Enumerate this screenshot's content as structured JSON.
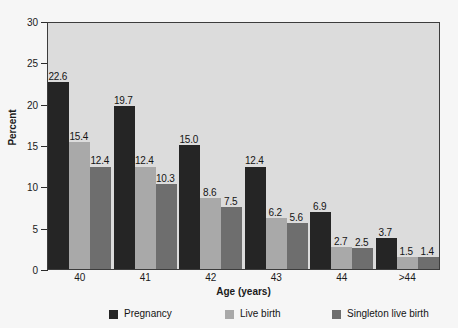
{
  "chart_data": {
    "type": "bar",
    "title": "",
    "xlabel": "Age (years)",
    "ylabel": "Percent",
    "categories": [
      "40",
      "41",
      "42",
      "43",
      "44",
      ">44"
    ],
    "series": [
      {
        "name": "Pregnancy",
        "color": "#252525",
        "values": [
          22.6,
          19.7,
          15.0,
          12.4,
          6.9,
          3.7
        ]
      },
      {
        "name": "Live birth",
        "color": "#a9a9a9",
        "values": [
          15.4,
          12.4,
          8.6,
          6.2,
          2.7,
          1.5
        ]
      },
      {
        "name": "Singleton live birth",
        "color": "#6e6e6e",
        "values": [
          12.4,
          10.3,
          7.5,
          5.6,
          2.5,
          1.4
        ]
      }
    ],
    "value_labels": [
      [
        "22.6",
        "15.4",
        "12.4"
      ],
      [
        "19.7",
        "12.4",
        "10.3"
      ],
      [
        "15.0",
        "8.6",
        "7.5"
      ],
      [
        "12.4",
        "6.2",
        "5.6"
      ],
      [
        "6.9",
        "2.7",
        "2.5"
      ],
      [
        "3.7",
        "1.5",
        "1.4"
      ]
    ],
    "ylim": [
      0,
      30
    ],
    "yticks": [
      0,
      5,
      10,
      15,
      20,
      25,
      30
    ],
    "ytick_labels": [
      "0",
      "5",
      "10",
      "15",
      "20",
      "25",
      "30"
    ],
    "grid": false,
    "legend_position": "bottom",
    "plot_background": "#dcdcdc",
    "figure_background": "#f6f6f6",
    "axis_color": "#3c3c3c"
  }
}
